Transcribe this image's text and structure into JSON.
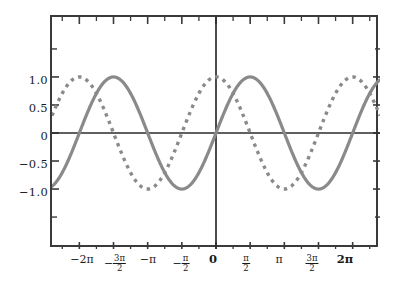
{
  "chart_data": {
    "type": "line",
    "title": "",
    "xlabel": "",
    "ylabel": "",
    "xlim": [
      -7.54,
      7.54
    ],
    "ylim": [
      -2.07,
      2.07
    ],
    "grid": false,
    "legend": "none",
    "background": "#ffffff",
    "frame_color": "#3a3a3a",
    "x_ticks": [
      {
        "value": -6.2832,
        "label": "−2π",
        "kind": "plain",
        "bold": false
      },
      {
        "value": -4.7124,
        "label": "−3π/2",
        "kind": "frac",
        "bold": false,
        "num": "3π",
        "den": "2",
        "sign": "−"
      },
      {
        "value": -3.1416,
        "label": "−π",
        "kind": "plain",
        "bold": false
      },
      {
        "value": -1.5708,
        "label": "−π/2",
        "kind": "frac",
        "bold": false,
        "num": "π",
        "den": "2",
        "sign": "−"
      },
      {
        "value": 0.0,
        "label": "0",
        "kind": "plain",
        "bold": true
      },
      {
        "value": 1.5708,
        "label": "π/2",
        "kind": "frac",
        "bold": false,
        "num": "π",
        "den": "2",
        "sign": ""
      },
      {
        "value": 3.1416,
        "label": "π",
        "kind": "plain",
        "bold": false
      },
      {
        "value": 4.7124,
        "label": "3π/2",
        "kind": "frac",
        "bold": false,
        "num": "3π",
        "den": "2",
        "sign": ""
      },
      {
        "value": 6.2832,
        "label": "2π",
        "kind": "plain",
        "bold": true
      }
    ],
    "x_minor_ticks": [
      -7.0686,
      -5.4978,
      -3.927,
      -2.3562,
      -0.7854,
      0.7854,
      2.3562,
      3.927,
      5.4978,
      7.0686
    ],
    "y_ticks": [
      {
        "value": 1.0,
        "label": "1.0"
      },
      {
        "value": 0.5,
        "label": "0.5"
      },
      {
        "value": 0.0,
        "label": "0"
      },
      {
        "value": -0.5,
        "label": "−0.5"
      },
      {
        "value": -1.0,
        "label": "−1.0"
      }
    ],
    "y_minor_ticks": [
      1.5,
      -1.5
    ],
    "axes": {
      "x_axis_at_y": 0.0,
      "y_axis_at_x": 0.0,
      "color": "#2b2b2b"
    },
    "series": [
      {
        "name": "sin(x)",
        "function": "sin",
        "style": "solid",
        "color": "#8a8a8a",
        "width": 3.2,
        "amplitude": 1.0,
        "phase": 0.0,
        "samples_x": [
          -7.54,
          -7.0,
          -6.5,
          -6.0,
          -5.5,
          -5.0,
          -4.712,
          -4.5,
          -4.0,
          -3.5,
          -3.142,
          -3.0,
          -2.5,
          -2.0,
          -1.571,
          -1.0,
          -0.5,
          0.0,
          0.5,
          1.0,
          1.571,
          2.0,
          2.5,
          3.0,
          3.142,
          3.5,
          4.0,
          4.5,
          4.712,
          5.0,
          5.5,
          6.0,
          6.5,
          7.0,
          7.54
        ],
        "samples_y": [
          -0.95,
          -0.657,
          -0.216,
          0.279,
          0.706,
          0.959,
          1.0,
          0.978,
          0.757,
          0.351,
          0.0,
          -0.141,
          -0.599,
          -0.909,
          -1.0,
          -0.841,
          -0.479,
          0.0,
          0.479,
          0.841,
          1.0,
          0.909,
          0.599,
          0.141,
          0.0,
          -0.351,
          -0.757,
          -0.978,
          -1.0,
          -0.959,
          -0.706,
          -0.279,
          0.216,
          0.657,
          0.95
        ]
      },
      {
        "name": "cos(x)",
        "function": "cos",
        "style": "dotted",
        "color": "#8a8a8a",
        "width": 3.4,
        "amplitude": 1.0,
        "phase": 1.5708,
        "samples_x": [
          -7.54,
          -7.0,
          -6.5,
          -6.0,
          -5.5,
          -5.0,
          -4.712,
          -4.0,
          -3.5,
          -3.142,
          -2.5,
          -2.0,
          -1.571,
          -1.0,
          -0.5,
          0.0,
          0.5,
          1.0,
          1.571,
          2.0,
          2.5,
          3.142,
          3.5,
          4.0,
          4.712,
          5.0,
          5.5,
          6.0,
          6.5,
          7.0,
          7.54
        ],
        "samples_y": [
          0.306,
          0.754,
          0.977,
          0.96,
          0.709,
          0.284,
          0.0,
          -0.654,
          -0.936,
          -1.0,
          -0.801,
          -0.416,
          0.0,
          0.54,
          0.878,
          1.0,
          0.878,
          0.54,
          0.0,
          -0.416,
          -0.801,
          -1.0,
          -0.936,
          -0.654,
          0.0,
          0.284,
          0.709,
          0.96,
          0.977,
          0.754,
          0.306
        ]
      }
    ]
  }
}
